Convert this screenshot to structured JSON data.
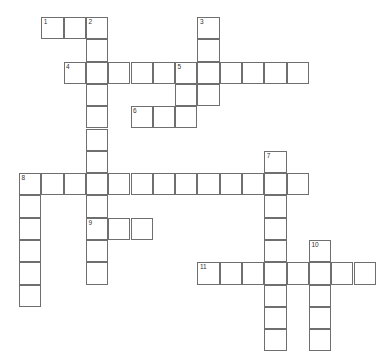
{
  "puzzle": {
    "type": "crossword-grid",
    "title": "",
    "grid": {
      "cell_size": 22.3,
      "origin_x": 19,
      "origin_y": 17,
      "columns": 16,
      "rows": 15,
      "border_color": "#6f6f6f",
      "cell_fill": "#ffffff",
      "number_color": "#333333"
    },
    "entries": [
      {
        "number": "1",
        "direction": "across",
        "row": 0,
        "col": 1,
        "length": 3
      },
      {
        "number": "2",
        "direction": "down",
        "row": 0,
        "col": 3,
        "length": 9
      },
      {
        "number": "3",
        "direction": "down",
        "row": 0,
        "col": 8,
        "length": 4
      },
      {
        "number": "4",
        "direction": "across",
        "row": 2,
        "col": 2,
        "length": 11
      },
      {
        "number": "5",
        "direction": "down",
        "row": 2,
        "col": 7,
        "length": 3
      },
      {
        "number": "6",
        "direction": "across",
        "row": 4,
        "col": 5,
        "length": 3
      },
      {
        "number": "7",
        "direction": "down",
        "row": 6,
        "col": 11,
        "length": 9
      },
      {
        "number": "8",
        "direction": "across",
        "row": 7,
        "col": 0,
        "length": 13
      },
      {
        "number": "8",
        "direction": "down",
        "row": 7,
        "col": 0,
        "length": 6
      },
      {
        "number": "9",
        "direction": "across",
        "row": 9,
        "col": 3,
        "length": 3
      },
      {
        "number": "10",
        "direction": "down",
        "row": 10,
        "col": 13,
        "length": 5
      },
      {
        "number": "11",
        "direction": "across",
        "row": 11,
        "col": 8,
        "length": 8
      }
    ],
    "cells": [
      {
        "row": 0,
        "col": 1,
        "number": "1",
        "letter": ""
      },
      {
        "row": 0,
        "col": 2,
        "number": "",
        "letter": ""
      },
      {
        "row": 0,
        "col": 3,
        "number": "2",
        "letter": ""
      },
      {
        "row": 0,
        "col": 8,
        "number": "3",
        "letter": ""
      },
      {
        "row": 1,
        "col": 3,
        "number": "",
        "letter": ""
      },
      {
        "row": 1,
        "col": 8,
        "number": "",
        "letter": ""
      },
      {
        "row": 2,
        "col": 2,
        "number": "4",
        "letter": ""
      },
      {
        "row": 2,
        "col": 3,
        "number": "",
        "letter": ""
      },
      {
        "row": 2,
        "col": 4,
        "number": "",
        "letter": ""
      },
      {
        "row": 2,
        "col": 5,
        "number": "",
        "letter": ""
      },
      {
        "row": 2,
        "col": 6,
        "number": "",
        "letter": ""
      },
      {
        "row": 2,
        "col": 7,
        "number": "5",
        "letter": ""
      },
      {
        "row": 2,
        "col": 8,
        "number": "",
        "letter": ""
      },
      {
        "row": 2,
        "col": 9,
        "number": "",
        "letter": ""
      },
      {
        "row": 2,
        "col": 10,
        "number": "",
        "letter": ""
      },
      {
        "row": 2,
        "col": 11,
        "number": "",
        "letter": ""
      },
      {
        "row": 2,
        "col": 12,
        "number": "",
        "letter": ""
      },
      {
        "row": 3,
        "col": 3,
        "number": "",
        "letter": ""
      },
      {
        "row": 3,
        "col": 7,
        "number": "",
        "letter": ""
      },
      {
        "row": 3,
        "col": 8,
        "number": "",
        "letter": ""
      },
      {
        "row": 4,
        "col": 3,
        "number": "",
        "letter": ""
      },
      {
        "row": 4,
        "col": 5,
        "number": "6",
        "letter": ""
      },
      {
        "row": 4,
        "col": 6,
        "number": "",
        "letter": ""
      },
      {
        "row": 4,
        "col": 7,
        "number": "",
        "letter": ""
      },
      {
        "row": 5,
        "col": 3,
        "number": "",
        "letter": ""
      },
      {
        "row": 6,
        "col": 3,
        "number": "",
        "letter": ""
      },
      {
        "row": 6,
        "col": 11,
        "number": "7",
        "letter": ""
      },
      {
        "row": 7,
        "col": 0,
        "number": "8",
        "letter": ""
      },
      {
        "row": 7,
        "col": 1,
        "number": "",
        "letter": ""
      },
      {
        "row": 7,
        "col": 2,
        "number": "",
        "letter": ""
      },
      {
        "row": 7,
        "col": 3,
        "number": "",
        "letter": ""
      },
      {
        "row": 7,
        "col": 4,
        "number": "",
        "letter": ""
      },
      {
        "row": 7,
        "col": 5,
        "number": "",
        "letter": ""
      },
      {
        "row": 7,
        "col": 6,
        "number": "",
        "letter": ""
      },
      {
        "row": 7,
        "col": 7,
        "number": "",
        "letter": ""
      },
      {
        "row": 7,
        "col": 8,
        "number": "",
        "letter": ""
      },
      {
        "row": 7,
        "col": 9,
        "number": "",
        "letter": ""
      },
      {
        "row": 7,
        "col": 10,
        "number": "",
        "letter": ""
      },
      {
        "row": 7,
        "col": 11,
        "number": "",
        "letter": ""
      },
      {
        "row": 7,
        "col": 12,
        "number": "",
        "letter": ""
      },
      {
        "row": 8,
        "col": 0,
        "number": "",
        "letter": ""
      },
      {
        "row": 8,
        "col": 3,
        "number": "",
        "letter": ""
      },
      {
        "row": 8,
        "col": 11,
        "number": "",
        "letter": ""
      },
      {
        "row": 9,
        "col": 0,
        "number": "",
        "letter": ""
      },
      {
        "row": 9,
        "col": 3,
        "number": "9",
        "letter": ""
      },
      {
        "row": 9,
        "col": 4,
        "number": "",
        "letter": ""
      },
      {
        "row": 9,
        "col": 5,
        "number": "",
        "letter": ""
      },
      {
        "row": 9,
        "col": 11,
        "number": "",
        "letter": ""
      },
      {
        "row": 10,
        "col": 0,
        "number": "",
        "letter": ""
      },
      {
        "row": 10,
        "col": 3,
        "number": "",
        "letter": ""
      },
      {
        "row": 10,
        "col": 11,
        "number": "",
        "letter": ""
      },
      {
        "row": 10,
        "col": 13,
        "number": "10",
        "letter": ""
      },
      {
        "row": 11,
        "col": 0,
        "number": "",
        "letter": ""
      },
      {
        "row": 11,
        "col": 3,
        "number": "",
        "letter": ""
      },
      {
        "row": 11,
        "col": 8,
        "number": "11",
        "letter": ""
      },
      {
        "row": 11,
        "col": 9,
        "number": "",
        "letter": ""
      },
      {
        "row": 11,
        "col": 10,
        "number": "",
        "letter": ""
      },
      {
        "row": 11,
        "col": 11,
        "number": "",
        "letter": ""
      },
      {
        "row": 11,
        "col": 12,
        "number": "",
        "letter": ""
      },
      {
        "row": 11,
        "col": 13,
        "number": "",
        "letter": ""
      },
      {
        "row": 11,
        "col": 14,
        "number": "",
        "letter": ""
      },
      {
        "row": 11,
        "col": 15,
        "number": "",
        "letter": ""
      },
      {
        "row": 12,
        "col": 0,
        "number": "",
        "letter": ""
      },
      {
        "row": 12,
        "col": 11,
        "number": "",
        "letter": ""
      },
      {
        "row": 12,
        "col": 13,
        "number": "",
        "letter": ""
      },
      {
        "row": 13,
        "col": 11,
        "number": "",
        "letter": ""
      },
      {
        "row": 13,
        "col": 13,
        "number": "",
        "letter": ""
      },
      {
        "row": 14,
        "col": 11,
        "number": "",
        "letter": ""
      },
      {
        "row": 14,
        "col": 13,
        "number": "",
        "letter": ""
      }
    ]
  }
}
